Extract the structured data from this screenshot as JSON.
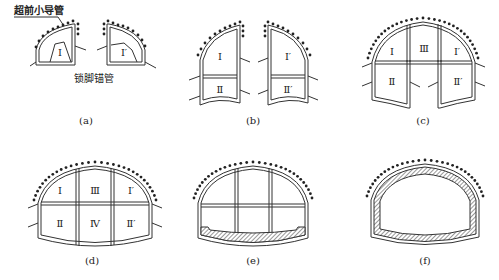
{
  "figure": {
    "labels": {
      "advance_pipe": "超前小导管",
      "foot_lock_pipe": "锁脚锚管"
    },
    "panels": [
      {
        "id": "a",
        "caption": "(a)",
        "sections": [
          "Ⅰ",
          "Ⅰ′"
        ]
      },
      {
        "id": "b",
        "caption": "(b)",
        "sections": [
          "Ⅰ",
          "Ⅱ",
          "Ⅰ′",
          "Ⅱ′"
        ]
      },
      {
        "id": "c",
        "caption": "(c)",
        "sections": [
          "Ⅰ",
          "Ⅲ",
          "Ⅰ′",
          "Ⅱ",
          "Ⅱ′"
        ]
      },
      {
        "id": "d",
        "caption": "(d)",
        "sections": [
          "Ⅰ",
          "Ⅲ",
          "Ⅰ′",
          "Ⅱ",
          "Ⅳ",
          "Ⅱ′"
        ]
      },
      {
        "id": "e",
        "caption": "(e)",
        "sections": []
      },
      {
        "id": "f",
        "caption": "(f)",
        "sections": []
      }
    ]
  }
}
